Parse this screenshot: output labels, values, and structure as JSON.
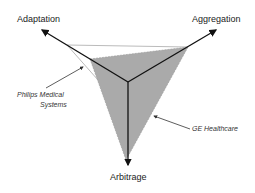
{
  "axes": {
    "adaptation": "Adaptation",
    "aggregation": "Aggregation",
    "arbitrage": "Arbitrage"
  },
  "series": [
    {
      "name": "Philips Medical Systems",
      "label_line1": "Philips Medical",
      "label_line2": "Systems",
      "style": "light-outline"
    },
    {
      "name": "GE Healthcare",
      "label": "GE Healthcare",
      "style": "gray-fill",
      "fill": "#aaaaaa"
    }
  ],
  "colors": {
    "axis": "#111111",
    "fill": "#aaaaaa",
    "outline": "#bbbbbb"
  }
}
